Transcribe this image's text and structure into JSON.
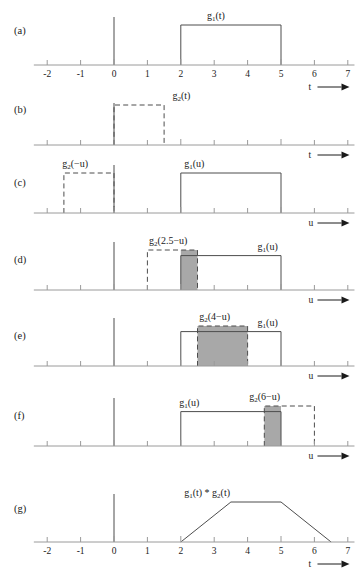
{
  "figure": {
    "axis_ticks": [
      "-2",
      "-1",
      "0",
      "1",
      "2",
      "3",
      "4",
      "5",
      "6",
      "7"
    ],
    "axis_tick_values": [
      -2,
      -1,
      0,
      1,
      2,
      3,
      4,
      5,
      6,
      7
    ],
    "axis_min": -2.4,
    "axis_max": 7.2,
    "colors": {
      "signal_stroke": "#4d4d4d",
      "axis_stroke": "#9a9a9a",
      "overlap_fill": "#a8a8a8",
      "text": "#1a1a1a",
      "background": "#ffffff"
    },
    "panels": [
      {
        "id": "a",
        "label": "(a)",
        "axis_name": "t",
        "axis_arrow": "→",
        "show_tick_labels": true,
        "signals": [
          {
            "name": "g1-t",
            "label": "g",
            "sub": "1",
            "arg": "(t)",
            "style": "solid",
            "start": 2,
            "end": 5,
            "height": 1.0,
            "label_x": 3.05,
            "label_anchor": "middle"
          }
        ],
        "overlap": null
      },
      {
        "id": "b",
        "label": "(b)",
        "axis_name": "t",
        "axis_arrow": "→",
        "show_tick_labels": false,
        "signals": [
          {
            "name": "g2-t",
            "label": "g",
            "sub": "2",
            "arg": "(t)",
            "style": "dashed",
            "start": 0,
            "end": 1.5,
            "height": 1.0,
            "label_x": 1.75,
            "label_anchor": "start"
          }
        ],
        "overlap": null
      },
      {
        "id": "c",
        "label": "(c)",
        "axis_name": "u",
        "axis_arrow": "→",
        "show_tick_labels": false,
        "signals": [
          {
            "name": "g2-minus-u",
            "label": "g",
            "sub": "2",
            "arg": "(−u)",
            "style": "dashed",
            "start": -1.5,
            "end": 0,
            "height": 1.0,
            "label_x": -1.55,
            "label_anchor": "start"
          },
          {
            "name": "g1-u",
            "label": "g",
            "sub": "1",
            "arg": "(u)",
            "style": "solid",
            "start": 2,
            "end": 5,
            "height": 1.0,
            "label_x": 2.1,
            "label_anchor": "start"
          }
        ],
        "overlap": null
      },
      {
        "id": "d",
        "label": "(d)",
        "axis_name": "u",
        "axis_arrow": "→",
        "show_tick_labels": false,
        "signals": [
          {
            "name": "g2-2p5-minus-u",
            "label": "g",
            "sub": "2",
            "arg": "(2.5−u)",
            "style": "dashed",
            "start": 1,
            "end": 2.5,
            "height": 1.0,
            "label_x": 1.05,
            "label_anchor": "start"
          },
          {
            "name": "g1-u",
            "label": "g",
            "sub": "1",
            "arg": "(u)",
            "style": "solid",
            "start": 2,
            "end": 5,
            "height": 0.86,
            "label_x": 4.3,
            "label_anchor": "start"
          }
        ],
        "overlap": {
          "start": 2,
          "end": 2.5,
          "height": 1.0
        }
      },
      {
        "id": "e",
        "label": "(e)",
        "axis_name": "u",
        "axis_arrow": "→",
        "show_tick_labels": false,
        "signals": [
          {
            "name": "g2-4-minus-u",
            "label": "g",
            "sub": "2",
            "arg": "(4−u)",
            "style": "dashed",
            "start": 2.5,
            "end": 4,
            "height": 1.0,
            "label_x": 2.55,
            "label_anchor": "start"
          },
          {
            "name": "g1-u",
            "label": "g",
            "sub": "1",
            "arg": "(u)",
            "style": "solid",
            "start": 2,
            "end": 5,
            "height": 0.86,
            "label_x": 4.3,
            "label_anchor": "start"
          }
        ],
        "overlap": {
          "start": 2.5,
          "end": 4,
          "height": 1.0
        }
      },
      {
        "id": "f",
        "label": "(f)",
        "axis_name": "u",
        "axis_arrow": "→",
        "show_tick_labels": false,
        "signals": [
          {
            "name": "g2-6-minus-u",
            "label": "g",
            "sub": "2",
            "arg": "(6−u)",
            "style": "dashed",
            "start": 4.5,
            "end": 6,
            "height": 1.0,
            "label_x": 4.05,
            "label_anchor": "start"
          },
          {
            "name": "g1-u",
            "label": "g",
            "sub": "1",
            "arg": "(u)",
            "style": "solid",
            "start": 2,
            "end": 5,
            "height": 0.86,
            "label_x": 1.95,
            "label_anchor": "start"
          }
        ],
        "overlap": {
          "start": 4.5,
          "end": 5,
          "height": 1.0
        }
      },
      {
        "id": "g",
        "label": "(g)",
        "axis_name": "t",
        "axis_arrow": "→",
        "show_tick_labels": true,
        "signals": [
          {
            "name": "g1-conv-g2",
            "label": "g",
            "sub": "1",
            "arg": "(t) * g",
            "sub2": "2",
            "arg2": "(t)",
            "style": "trapezoid",
            "label_x": 2.1,
            "label_anchor": "start",
            "points": [
              [
                2,
                0
              ],
              [
                3.5,
                1.0
              ],
              [
                5,
                1.0
              ],
              [
                6.5,
                0
              ]
            ]
          }
        ],
        "overlap": null
      }
    ]
  }
}
